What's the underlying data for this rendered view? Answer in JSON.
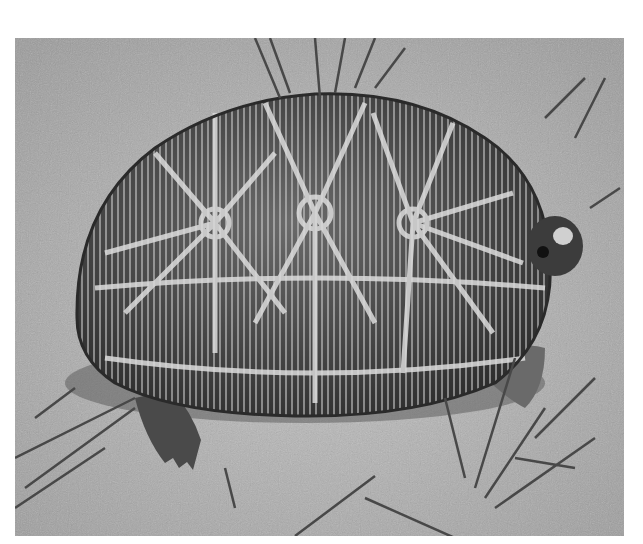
{
  "image": {
    "subject": "tortoise",
    "description": "Grayscale photograph of a star-patterned tortoise on sandy ground with sparse grass blades",
    "colors": {
      "background": "#ffffff",
      "ground": "#b4b4b4",
      "shell_dark": "#3a3a3a",
      "shell_light": "#d8d8d8",
      "grass": "#4a4a4a"
    }
  }
}
